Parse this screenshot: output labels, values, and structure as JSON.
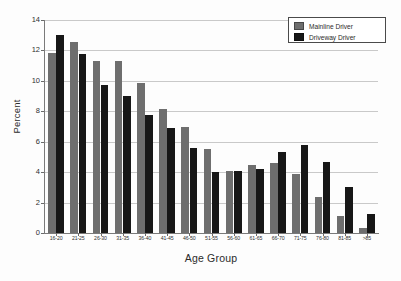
{
  "chart_data": {
    "type": "bar",
    "title": "",
    "xlabel": "Age Group",
    "ylabel": "Percent",
    "ylim": [
      0,
      14
    ],
    "yticks": [
      0,
      2,
      4,
      6,
      8,
      10,
      12,
      14
    ],
    "grid": true,
    "legend_position": "top-right",
    "categories": [
      "16-20",
      "21-25",
      "26-30",
      "31-35",
      "36-40",
      "41-45",
      "46-50",
      "51-55",
      "56-60",
      "61-65",
      "66-70",
      "71-75",
      "76-80",
      "81-85",
      ">85"
    ],
    "series": [
      {
        "name": "Mainline Driver",
        "color": "#6e6e6e",
        "values": [
          11.85,
          12.55,
          11.3,
          11.3,
          9.85,
          8.15,
          7.0,
          5.5,
          4.1,
          4.5,
          4.6,
          3.85,
          2.4,
          1.1,
          0.35
        ]
      },
      {
        "name": "Driveway Driver",
        "color": "#171717",
        "values": [
          13.0,
          11.75,
          9.7,
          9.0,
          7.75,
          6.9,
          5.6,
          4.0,
          4.05,
          4.2,
          5.3,
          5.8,
          4.65,
          3.0,
          1.25
        ]
      }
    ]
  },
  "legend": {
    "items": [
      {
        "label": "Mainline Driver",
        "swatch": "mainline"
      },
      {
        "label": "Driveway Driver",
        "swatch": "driveway"
      }
    ]
  },
  "axes": {
    "y_title": "Percent",
    "x_title": "Age Group"
  }
}
